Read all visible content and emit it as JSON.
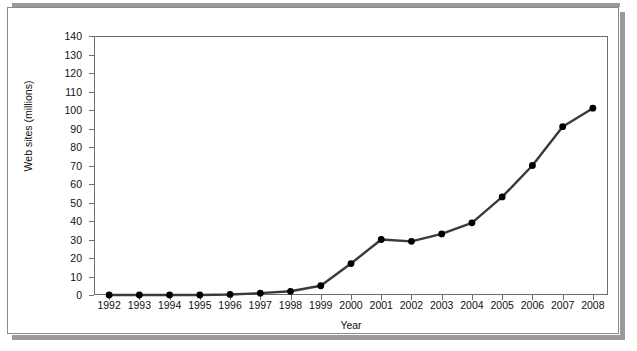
{
  "chart_data": {
    "type": "line",
    "title": "",
    "xlabel": "Year",
    "ylabel": "Web sites (millions)",
    "categories": [
      "1992",
      "1993",
      "1994",
      "1995",
      "1996",
      "1997",
      "1998",
      "1999",
      "2000",
      "2001",
      "2002",
      "2003",
      "2004",
      "2005",
      "2006",
      "2007",
      "2008"
    ],
    "values": [
      0,
      0,
      0,
      0,
      0.3,
      1,
      2,
      5,
      17,
      30,
      29,
      33,
      39,
      53,
      70,
      91,
      101
    ],
    "series": [
      {
        "name": "Web sites",
        "values": [
          0,
          0,
          0,
          0,
          0.3,
          1,
          2,
          5,
          17,
          30,
          29,
          33,
          39,
          53,
          70,
          91,
          101
        ]
      }
    ],
    "ylim": [
      0,
      140
    ],
    "y_ticks": [
      0,
      10,
      20,
      30,
      40,
      50,
      60,
      70,
      80,
      90,
      100,
      110,
      120,
      130,
      140
    ],
    "y_tick_labels": [
      "0",
      "10",
      "20",
      "30",
      "40",
      "50",
      "60",
      "70",
      "80",
      "90",
      "100",
      "110",
      "120",
      "130",
      "140"
    ],
    "xlim_categories": [
      "1992",
      "2008"
    ],
    "grid": false,
    "legend": false,
    "legend_position": "none",
    "marker": "circle",
    "line_color": "#3a3a3a",
    "marker_color": "#000000"
  },
  "figure": {
    "border_color": "#8a8a8a",
    "shadow_color": "#9a9a9a",
    "plot_border_color": "#6e6e6e",
    "background": "#ffffff"
  }
}
